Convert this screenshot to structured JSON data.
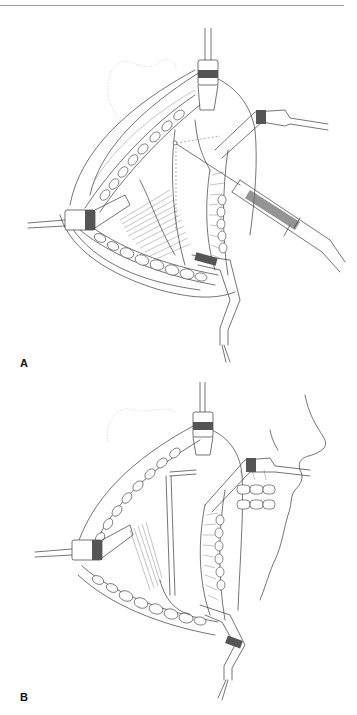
{
  "page": {
    "header_rule": true
  },
  "figures": [
    {
      "label": "A",
      "description": "Line illustration of surgical field held open by four retractors, with a needle/syringe instrument inserted and a dashed incision outline"
    },
    {
      "label": "B",
      "description": "Line illustration of surgical field held open by four retractors with facial profile and teeth visible at right, showing rectangular exposed region"
    }
  ],
  "colors": {
    "background": "#ffffff",
    "line_art": "#3a3a3a",
    "rule": "#9a9a9a"
  }
}
